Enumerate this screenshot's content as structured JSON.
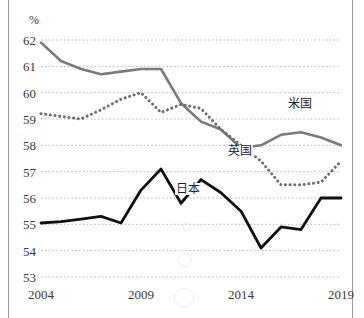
{
  "figure": {
    "unit_label": "%",
    "background_color": "#ffffff",
    "rule_color": "#9a9a9a"
  },
  "chart_data": {
    "type": "line",
    "title": "",
    "subtitle": "",
    "xlabel": "",
    "ylabel": "%",
    "xlim": [
      2004,
      2019
    ],
    "ylim": [
      53,
      62
    ],
    "ytick_labels": [
      "53",
      "54",
      "55",
      "56",
      "57",
      "58",
      "59",
      "60",
      "61",
      "62"
    ],
    "ytick_values": [
      53,
      54,
      55,
      56,
      57,
      58,
      59,
      60,
      61,
      62
    ],
    "xtick_labels": [
      "2004",
      "2009",
      "2014",
      "2019"
    ],
    "xtick_values": [
      2004,
      2009,
      2014,
      2019
    ],
    "grid": true,
    "grid_style": "dotted",
    "grid_color": "#b9b9b9",
    "legend": "inline-annotations",
    "x": [
      2004,
      2005,
      2006,
      2007,
      2008,
      2009,
      2010,
      2011,
      2012,
      2013,
      2014,
      2015,
      2016,
      2017,
      2018,
      2019
    ],
    "series": [
      {
        "name": "米国",
        "label": "米国",
        "style": "solid",
        "color": "#7a7a7a",
        "width": 2.6,
        "label_x": 2017.0,
        "label_y": 59.55,
        "values": [
          61.9,
          61.2,
          60.9,
          60.7,
          60.8,
          60.9,
          60.9,
          59.6,
          58.9,
          58.6,
          57.9,
          58.0,
          58.4,
          58.5,
          58.3,
          58.0
        ]
      },
      {
        "name": "英国",
        "label": "英国",
        "style": "dotted",
        "color": "#6e6e6e",
        "width": 3.0,
        "label_x": 2014.0,
        "label_y": 57.75,
        "values": [
          59.2,
          59.1,
          59.0,
          59.35,
          59.75,
          60.0,
          59.25,
          59.55,
          59.4,
          58.6,
          58.0,
          57.4,
          56.5,
          56.5,
          56.6,
          57.4
        ]
      },
      {
        "name": "日本",
        "label": "日本",
        "style": "solid",
        "color": "#111111",
        "width": 2.8,
        "label_x": 2011.4,
        "label_y": 56.3,
        "values": [
          55.05,
          55.1,
          55.2,
          55.3,
          55.05,
          56.3,
          57.1,
          55.8,
          56.7,
          56.2,
          55.5,
          54.1,
          54.9,
          54.8,
          56.0,
          56.0
        ]
      }
    ]
  }
}
